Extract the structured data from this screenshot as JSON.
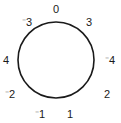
{
  "figure": {
    "name": "number-circle-diagram",
    "background_color": "#ffffff",
    "stroke_color": "#1a1a1a",
    "text_color": "#1a1a1a",
    "width": 121,
    "height": 123
  },
  "circle": {
    "center_x": 56,
    "center_y": 60,
    "radius": 38,
    "stroke_width": 1.6
  },
  "chart_data": {
    "type": "scatter",
    "title": "",
    "xlabel": "",
    "ylabel": "",
    "categories": [
      "top",
      "upper-right",
      "right",
      "lower-right",
      "bottom-right",
      "bottom-left",
      "lower-left",
      "left",
      "upper-left"
    ],
    "values": [
      "0",
      "3",
      "-4",
      "2",
      "1",
      "-1",
      "-2",
      "4",
      "-3"
    ],
    "grid": false,
    "legend": "none"
  },
  "labels": [
    {
      "id": "label-top",
      "sign": "",
      "value": "0",
      "x": 56,
      "y": 9,
      "angle_deg": 90
    },
    {
      "id": "label-upper-right",
      "sign": "",
      "value": "3",
      "x": 89,
      "y": 22,
      "angle_deg": 50
    },
    {
      "id": "label-right",
      "sign": "⁻",
      "value": "4",
      "x": 110,
      "y": 60,
      "angle_deg": 0
    },
    {
      "id": "label-lower-right",
      "sign": "",
      "value": "2",
      "x": 107,
      "y": 94,
      "angle_deg": -40
    },
    {
      "id": "label-bottom-right",
      "sign": "",
      "value": "1",
      "x": 70,
      "y": 114,
      "angle_deg": -70
    },
    {
      "id": "label-bottom-left",
      "sign": "⁻",
      "value": "1",
      "x": 40,
      "y": 114,
      "angle_deg": -110
    },
    {
      "id": "label-lower-left",
      "sign": "⁻",
      "value": "2",
      "x": 10,
      "y": 94,
      "angle_deg": -140
    },
    {
      "id": "label-left",
      "sign": "",
      "value": "4",
      "x": 6,
      "y": 60,
      "angle_deg": 180
    },
    {
      "id": "label-upper-left",
      "sign": "⁻",
      "value": "3",
      "x": 27,
      "y": 22,
      "angle_deg": 130
    }
  ]
}
